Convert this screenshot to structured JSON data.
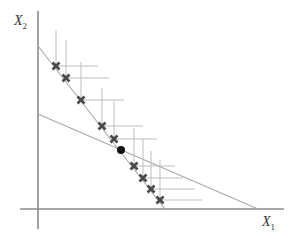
{
  "diagram": {
    "axes": {
      "x_label": "X",
      "x_label_sub": "1",
      "y_label": "X",
      "y_label_sub": "2",
      "origin_px": [
        38,
        209
      ],
      "x_axis_end_px": 284,
      "y_axis_top_px": 11,
      "y_axis_bottom_px": 229
    },
    "lines": [
      {
        "name": "steep-line",
        "from_px": [
          38,
          46
        ],
        "to_px": [
          165,
          209
        ]
      },
      {
        "name": "shallow-line",
        "from_px": [
          38,
          114
        ],
        "to_px": [
          258,
          209
        ]
      }
    ],
    "markers": [
      {
        "x": 56,
        "y": 66,
        "v_top": 30,
        "h_end": 98
      },
      {
        "x": 66,
        "y": 78,
        "v_top": 40,
        "h_end": 109
      },
      {
        "x": 81,
        "y": 100,
        "v_top": 62,
        "h_end": 124
      },
      {
        "x": 102,
        "y": 126,
        "v_top": 88,
        "h_end": 143
      },
      {
        "x": 114,
        "y": 139,
        "v_top": 101,
        "h_end": 157
      },
      {
        "x": 134,
        "y": 166,
        "v_top": 128,
        "h_end": 175
      },
      {
        "x": 143,
        "y": 178,
        "v_top": 139,
        "h_end": 183
      },
      {
        "x": 151,
        "y": 189,
        "v_top": 151,
        "h_end": 195
      },
      {
        "x": 160,
        "y": 200,
        "v_top": 160,
        "h_end": 202
      }
    ],
    "intersection_dot": {
      "x": 121,
      "y": 150
    },
    "colors": {
      "axis": "#8a8a8a",
      "budget_line": "#a8a8a8",
      "guide": "#bdbdbd",
      "marker": "#4a4a4a",
      "dot": "#111111"
    }
  }
}
